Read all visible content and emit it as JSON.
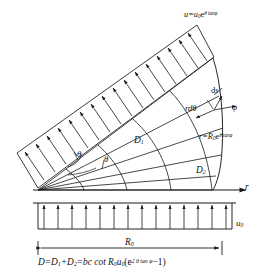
{
  "figure": {
    "background_color": "#ffffff",
    "line_color": "#1a1a1a",
    "hatch_color": "#555555"
  },
  "labels": {
    "velocity_top": {
      "text": "u=u",
      "sub": "0",
      "e": "e",
      "exp": "θ tanφ"
    },
    "arc_element": "ds",
    "friction_angle": "φ",
    "arc_length": {
      "pre": "r",
      "d": "d",
      "theta": "θ"
    },
    "spiral_equation": {
      "lhs": "r=R",
      "sub0": "0",
      "e": "e",
      "exp": "θ tanφ"
    },
    "region_1": {
      "text": "D",
      "sub": "1"
    },
    "region_2": {
      "text": "D",
      "sub": "2"
    },
    "angle_inner": "θ",
    "angle_outer": "θ",
    "radial_axis": "r",
    "base_velocity": {
      "text": "u",
      "sub": "0"
    },
    "radius_dimension": {
      "text": "R",
      "sub": "0"
    },
    "drag_equation": {
      "p1": "D=D",
      "s1": "1",
      "p2": "+D",
      "s2": "2",
      "p3": "=bc cot R",
      "s3": "0",
      "p4": "u",
      "s4": "0",
      "p5": "(e",
      "exp": "2 θ tan φ",
      "p6": "−1)"
    }
  },
  "geometry": {
    "apex": [
      38,
      190
    ],
    "baseline_y": 190,
    "baseline_x_start": 33,
    "baseline_x_end": 248,
    "spiral_start_radius": 48,
    "spiral_end_radius": 175,
    "fan_angle_start_deg": -2,
    "fan_angle_end_deg": -62,
    "band_arrow_count": 17,
    "base_arrow_count": 14,
    "radial_line_count": 5,
    "arc_line_count": 4,
    "dimension_line": {
      "x1": 38,
      "x2": 222,
      "y": 248
    }
  }
}
